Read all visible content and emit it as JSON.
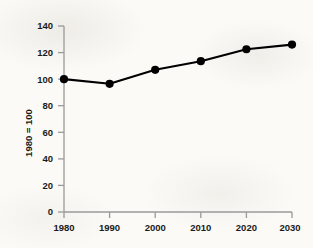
{
  "chart_data": {
    "type": "line",
    "title": "",
    "xlabel": "",
    "ylabel": "1980 = 100",
    "x": [
      1980,
      1990,
      2000,
      2010,
      2020,
      2030
    ],
    "values": [
      100,
      96.5,
      107,
      113.5,
      122.5,
      126
    ],
    "series": [
      {
        "name": "Index",
        "values": [
          100,
          96.5,
          107,
          113.5,
          122.5,
          126
        ]
      }
    ],
    "xlim": [
      1980,
      2030
    ],
    "ylim": [
      0,
      140
    ],
    "xticks": [
      "1980",
      "1990",
      "2000",
      "2010",
      "2020",
      "2030"
    ],
    "yticks": [
      "0",
      "20",
      "40",
      "60",
      "80",
      "100",
      "120",
      "140"
    ],
    "ytick_values": [
      0,
      20,
      40,
      60,
      80,
      100,
      120,
      140
    ],
    "grid": false,
    "legend": "none",
    "marker": "filled-circle",
    "line_color": "#000000",
    "marker_color": "#000000",
    "axis_color": "#9a9a9a",
    "background_color": "#fbfaf7"
  },
  "axes": {
    "y_axis_title": "1980 = 100",
    "y_tick_labels": [
      "140",
      "120",
      "100",
      "80",
      "60",
      "40",
      "20",
      "0"
    ],
    "x_tick_labels": [
      "1980",
      "1990",
      "2000",
      "2010",
      "2020",
      "2030"
    ]
  }
}
